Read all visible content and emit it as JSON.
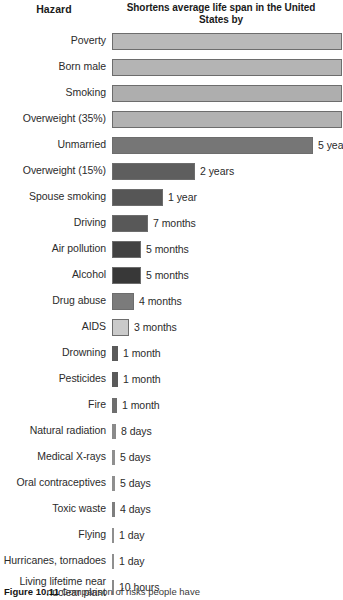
{
  "header": {
    "hazard_label": "Hazard",
    "value_label": "Shortens average life span\nin the United States by"
  },
  "caption": {
    "figure_number": "Figure 10.11",
    "text": "Comparison of risks people have"
  },
  "chart_data": {
    "type": "bar",
    "title": "Hazard",
    "xlabel": "Shortens average life span in the United States by",
    "ylabel": "Hazard",
    "orientation": "horizontal",
    "grid": false,
    "legend": "none",
    "note": "Bars for the first five hazards extend past the right edge of the cropped image; their labels are clipped.",
    "categories": [
      "Poverty",
      "Born male",
      "Smoking",
      "Overweight (35%)",
      "Unmarried",
      "Overweight (15%)",
      "Spouse smoking",
      "Driving",
      "Air pollution",
      "Alcohol",
      "Drug abuse",
      "AIDS",
      "Drowning",
      "Pesticides",
      "Fire",
      "Natural radiation",
      "Medical X-rays",
      "Oral contraceptives",
      "Toxic waste",
      "Flying",
      "Hurricanes, tornadoes",
      "Living lifetime near\nnuclear plant"
    ],
    "value_labels": [
      "",
      "",
      "",
      "",
      "5 yea",
      "2 years",
      "1 year",
      "7 months",
      "5 months",
      "5 months",
      "4 months",
      "3 months",
      "1 month",
      "1 month",
      "1 month",
      "8 days",
      "5 days",
      "5 days",
      "4 days",
      "1 day",
      "1 day",
      "10 hours"
    ],
    "values_days": [
      3285,
      2737,
      2190,
      1642,
      1825,
      730,
      365,
      213,
      152,
      152,
      122,
      91,
      30,
      30,
      30,
      8,
      5,
      5,
      4,
      1,
      1,
      0.42
    ],
    "bar_pixel_widths": [
      230,
      230,
      230,
      230,
      201,
      83,
      51,
      36,
      29,
      29,
      22,
      17,
      6,
      6,
      5,
      4,
      3,
      3,
      3,
      2,
      2,
      2
    ],
    "bar_colors": [
      "#b9b9b9",
      "#b4b4b4",
      "#aeaeae",
      "#b2b2b2",
      "#767676",
      "#5e5e5e",
      "#565656",
      "#585858",
      "#424242",
      "#383838",
      "#7b7b7b",
      "#cacaca",
      "#5a5a5a",
      "#5a5a5a",
      "#6e6e6e",
      "#8a8a8a",
      "#8f8f8f",
      "#8f8f8f",
      "#7e7e7e",
      "#8f8f8f",
      "#8f8f8f",
      "#8a8a8a"
    ],
    "bar_clipped": [
      true,
      true,
      true,
      true,
      false,
      false,
      false,
      false,
      false,
      false,
      false,
      false,
      false,
      false,
      false,
      false,
      false,
      false,
      false,
      false,
      false,
      false
    ]
  }
}
